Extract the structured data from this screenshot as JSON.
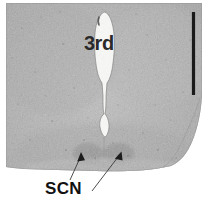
{
  "figure": {
    "kind": "histology-micrograph",
    "modality": "brightfield light micrograph, Nissl-stained coronal brain section",
    "width_px": 210,
    "height_px": 207,
    "background_color": "#ffffff"
  },
  "labels": {
    "ventricle": {
      "text": "3rd",
      "meaning": "third ventricle",
      "x": 84,
      "y": 33,
      "font_size_px": 20,
      "color": "#2a2a2a"
    },
    "nucleus": {
      "text": "SCN",
      "meaning": "suprachiasmatic nucleus",
      "x": 45,
      "y": 180,
      "font_size_px": 17,
      "color": "#111111"
    }
  },
  "pointers": [
    {
      "name": "arrow-scn-left",
      "from_x": 70,
      "from_y": 180,
      "to_x": 81,
      "to_y": 153,
      "color": "#1c1c1c"
    },
    {
      "name": "arrow-scn-right",
      "from_x": 92,
      "from_y": 191,
      "to_x": 121,
      "to_y": 152,
      "color": "#1c1c1c"
    }
  ],
  "scale_bar": {
    "name": "scale-bar",
    "orientation": "vertical",
    "x": 193,
    "y_top": 12,
    "y_bottom": 95,
    "length_px": 83,
    "thickness_px": 3,
    "color": "#1a1a1a",
    "caption": ""
  },
  "tissue": {
    "fill_color": "#b4b4b4",
    "edge_color": "#9a9a9a",
    "left_edge_x": 6,
    "right_edge_x": 202,
    "top_edge_y": 3,
    "bottom_edge_y": 170,
    "texture": "fine granular stipple"
  },
  "ventricle_lumen": {
    "name": "third-ventricle-lumen",
    "fill_color": "#f7f7f5",
    "shape": "teardrop tapering inferiorly to a narrow midline channel with a small lens-shaped dilation",
    "top_y": 12,
    "bottom_y": 137,
    "center_x": 104
  },
  "scn_nuclei": {
    "name": "suprachiasmatic-nuclei",
    "description": "paired dark cell-dense ovals flanking the ventral midline",
    "color": "#8d8d8d",
    "left_center": [
      88,
      152
    ],
    "right_center": [
      118,
      152
    ]
  }
}
